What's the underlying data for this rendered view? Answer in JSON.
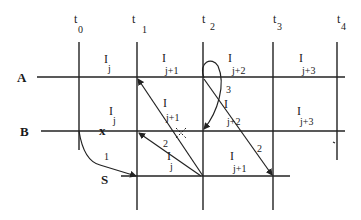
{
  "time_labels": [
    {
      "t": "t",
      "sub": "0"
    },
    {
      "t": "t",
      "sub": "1"
    },
    {
      "t": "t",
      "sub": "2"
    },
    {
      "t": "t",
      "sub": "3"
    },
    {
      "t": "t",
      "sub": "4"
    }
  ],
  "rows": {
    "A": "A",
    "B": "B",
    "S": "S"
  },
  "intervals": {
    "A": [
      {
        "i": "I",
        "sub": "j"
      },
      {
        "i": "I",
        "sub": "j+1"
      },
      {
        "i": "I",
        "sub": "j+2"
      },
      {
        "i": "I",
        "sub": "j+3"
      }
    ],
    "B": [
      {
        "i": "I",
        "sub": "j"
      },
      {
        "i": "I",
        "sub": "j+1"
      },
      {
        "i": "I",
        "sub": "j+2"
      },
      {
        "i": "I",
        "sub": "j+3"
      }
    ],
    "S": [
      {
        "i": "I",
        "sub": "j"
      },
      {
        "i": "I",
        "sub": "j+1"
      }
    ]
  },
  "arrow_labels": {
    "one": "1",
    "two_left": "2",
    "two_right": "2",
    "three": "3"
  },
  "markers": {
    "x": "x"
  }
}
